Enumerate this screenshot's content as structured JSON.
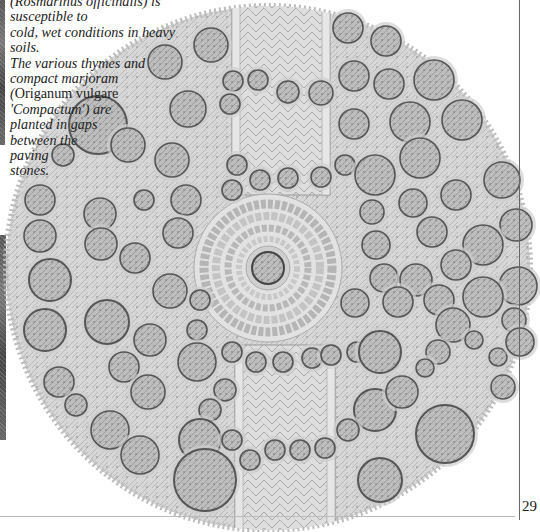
{
  "page": {
    "page_number": "29"
  },
  "caption": {
    "line_1": "(Rosmarinus officinalis) is susceptible to",
    "line_2": "cold, wet conditions in heavy soils.",
    "line_3": "The various thymes and",
    "line_4": "compact marjoram",
    "line_5_open": "(",
    "line_5_species": "Origanum vulgare",
    "line_6": "'Compactum') are",
    "line_7": "planted in gaps",
    "line_8": "between the",
    "line_9": "paving",
    "line_10": "stones."
  },
  "illustration": {
    "description": "Circular herb garden plan, top view, with herringbone-paved path and central circular paved area with a central plant",
    "colors": {
      "foliage": "#c9c9c9",
      "foliage_dark": "#9a9a9a",
      "circle_outline": "#555555",
      "paving": "#dcdcdc",
      "paving_line": "#a8a8a8"
    },
    "garden": {
      "cx": 268,
      "cy": 268,
      "r": 262
    },
    "central_circle": {
      "cx": 268,
      "cy": 268,
      "r": 72
    },
    "central_plant": {
      "cx": 268,
      "cy": 268,
      "r": 16
    },
    "paths": [
      {
        "name": "north-path",
        "x": 232,
        "y": 5,
        "w": 98,
        "h": 190
      },
      {
        "name": "south-path",
        "x": 235,
        "y": 345,
        "w": 100,
        "h": 187
      }
    ],
    "plants": [
      {
        "x": 165,
        "y": 62,
        "r": 17
      },
      {
        "x": 211,
        "y": 45,
        "r": 17
      },
      {
        "x": 348,
        "y": 28,
        "r": 15
      },
      {
        "x": 386,
        "y": 41,
        "r": 15
      },
      {
        "x": 98,
        "y": 125,
        "r": 29
      },
      {
        "x": 188,
        "y": 109,
        "r": 18
      },
      {
        "x": 233,
        "y": 81,
        "r": 10
      },
      {
        "x": 258,
        "y": 80,
        "r": 10
      },
      {
        "x": 230,
        "y": 104,
        "r": 10
      },
      {
        "x": 288,
        "y": 92,
        "r": 11
      },
      {
        "x": 321,
        "y": 93,
        "r": 12
      },
      {
        "x": 354,
        "y": 76,
        "r": 15
      },
      {
        "x": 389,
        "y": 84,
        "r": 15
      },
      {
        "x": 434,
        "y": 80,
        "r": 20
      },
      {
        "x": 410,
        "y": 122,
        "r": 20
      },
      {
        "x": 462,
        "y": 120,
        "r": 20
      },
      {
        "x": 354,
        "y": 124,
        "r": 15
      },
      {
        "x": 63,
        "y": 155,
        "r": 11
      },
      {
        "x": 128,
        "y": 145,
        "r": 17
      },
      {
        "x": 172,
        "y": 160,
        "r": 17
      },
      {
        "x": 237,
        "y": 165,
        "r": 10
      },
      {
        "x": 260,
        "y": 180,
        "r": 10
      },
      {
        "x": 288,
        "y": 178,
        "r": 10
      },
      {
        "x": 321,
        "y": 177,
        "r": 10
      },
      {
        "x": 345,
        "y": 165,
        "r": 10
      },
      {
        "x": 375,
        "y": 175,
        "r": 20
      },
      {
        "x": 420,
        "y": 158,
        "r": 20
      },
      {
        "x": 502,
        "y": 180,
        "r": 18
      },
      {
        "x": 232,
        "y": 190,
        "r": 10
      },
      {
        "x": 456,
        "y": 195,
        "r": 15
      },
      {
        "x": 40,
        "y": 200,
        "r": 15
      },
      {
        "x": 100,
        "y": 214,
        "r": 16
      },
      {
        "x": 144,
        "y": 200,
        "r": 10
      },
      {
        "x": 186,
        "y": 200,
        "r": 15
      },
      {
        "x": 372,
        "y": 212,
        "r": 12
      },
      {
        "x": 413,
        "y": 203,
        "r": 14
      },
      {
        "x": 516,
        "y": 225,
        "r": 16
      },
      {
        "x": 40,
        "y": 236,
        "r": 16
      },
      {
        "x": 101,
        "y": 244,
        "r": 16
      },
      {
        "x": 135,
        "y": 258,
        "r": 15
      },
      {
        "x": 178,
        "y": 233,
        "r": 15
      },
      {
        "x": 376,
        "y": 245,
        "r": 14
      },
      {
        "x": 432,
        "y": 232,
        "r": 15
      },
      {
        "x": 483,
        "y": 245,
        "r": 20
      },
      {
        "x": 50,
        "y": 280,
        "r": 21
      },
      {
        "x": 170,
        "y": 291,
        "r": 17
      },
      {
        "x": 384,
        "y": 278,
        "r": 14
      },
      {
        "x": 416,
        "y": 280,
        "r": 16
      },
      {
        "x": 456,
        "y": 265,
        "r": 15
      },
      {
        "x": 518,
        "y": 286,
        "r": 19
      },
      {
        "x": 107,
        "y": 322,
        "r": 22
      },
      {
        "x": 45,
        "y": 330,
        "r": 21
      },
      {
        "x": 200,
        "y": 300,
        "r": 10
      },
      {
        "x": 355,
        "y": 303,
        "r": 14
      },
      {
        "x": 398,
        "y": 302,
        "r": 15
      },
      {
        "x": 439,
        "y": 300,
        "r": 15
      },
      {
        "x": 483,
        "y": 297,
        "r": 20
      },
      {
        "x": 59,
        "y": 382,
        "r": 15
      },
      {
        "x": 150,
        "y": 340,
        "r": 16
      },
      {
        "x": 197,
        "y": 330,
        "r": 10
      },
      {
        "x": 453,
        "y": 325,
        "r": 17
      },
      {
        "x": 514,
        "y": 320,
        "r": 12
      },
      {
        "x": 232,
        "y": 352,
        "r": 10
      },
      {
        "x": 256,
        "y": 362,
        "r": 10
      },
      {
        "x": 283,
        "y": 362,
        "r": 10
      },
      {
        "x": 312,
        "y": 358,
        "r": 10
      },
      {
        "x": 331,
        "y": 355,
        "r": 10
      },
      {
        "x": 357,
        "y": 352,
        "r": 10
      },
      {
        "x": 380,
        "y": 352,
        "r": 21
      },
      {
        "x": 474,
        "y": 340,
        "r": 9
      },
      {
        "x": 498,
        "y": 357,
        "r": 9
      },
      {
        "x": 520,
        "y": 342,
        "r": 14
      },
      {
        "x": 124,
        "y": 367,
        "r": 15
      },
      {
        "x": 197,
        "y": 362,
        "r": 19
      },
      {
        "x": 438,
        "y": 352,
        "r": 12
      },
      {
        "x": 76,
        "y": 405,
        "r": 11
      },
      {
        "x": 148,
        "y": 392,
        "r": 17
      },
      {
        "x": 225,
        "y": 390,
        "r": 11
      },
      {
        "x": 375,
        "y": 410,
        "r": 21
      },
      {
        "x": 445,
        "y": 434,
        "r": 29
      },
      {
        "x": 425,
        "y": 368,
        "r": 9
      },
      {
        "x": 503,
        "y": 387,
        "r": 12
      },
      {
        "x": 110,
        "y": 430,
        "r": 19
      },
      {
        "x": 140,
        "y": 455,
        "r": 19
      },
      {
        "x": 210,
        "y": 410,
        "r": 11
      },
      {
        "x": 200,
        "y": 440,
        "r": 21
      },
      {
        "x": 232,
        "y": 440,
        "r": 10
      },
      {
        "x": 250,
        "y": 460,
        "r": 10
      },
      {
        "x": 275,
        "y": 450,
        "r": 10
      },
      {
        "x": 300,
        "y": 450,
        "r": 10
      },
      {
        "x": 325,
        "y": 448,
        "r": 10
      },
      {
        "x": 348,
        "y": 430,
        "r": 11
      },
      {
        "x": 205,
        "y": 480,
        "r": 31
      },
      {
        "x": 380,
        "y": 480,
        "r": 22
      },
      {
        "x": 402,
        "y": 392,
        "r": 16
      }
    ]
  }
}
